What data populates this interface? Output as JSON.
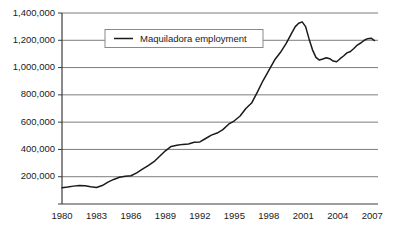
{
  "chart_data": {
    "type": "line",
    "title": "",
    "subtitle": "",
    "xlabel": "",
    "ylabel": "",
    "grid": "horizontal",
    "legend_position": "top-center",
    "xlim": [
      1980,
      2007.5
    ],
    "ylim": [
      0,
      1400000
    ],
    "yticks": [
      0,
      200000,
      400000,
      600000,
      800000,
      1000000,
      1200000,
      1400000
    ],
    "ytick_labels": [
      "",
      "200,000",
      "400,000",
      "600,000",
      "800,000",
      "1,000,000",
      "1,200,000",
      "1,400,000"
    ],
    "xticks": [
      1980,
      1983,
      1986,
      1989,
      1992,
      1995,
      1998,
      2001,
      2004,
      2007
    ],
    "xtick_labels": [
      "1980",
      "1983",
      "1986",
      "1989",
      "1992",
      "1995",
      "1998",
      "2001",
      "2004",
      "2007"
    ],
    "series": [
      {
        "name": "Maquiladora employment",
        "color": "#1a1a1a",
        "x": [
          1980.0,
          1980.5,
          1981.0,
          1981.5,
          1982.0,
          1982.5,
          1983.0,
          1983.5,
          1984.0,
          1984.5,
          1985.0,
          1985.5,
          1986.0,
          1986.5,
          1987.0,
          1987.5,
          1988.0,
          1988.5,
          1989.0,
          1989.5,
          1990.0,
          1990.5,
          1991.0,
          1991.5,
          1992.0,
          1992.5,
          1993.0,
          1993.5,
          1994.0,
          1994.5,
          1995.0,
          1995.5,
          1996.0,
          1996.5,
          1997.0,
          1997.5,
          1998.0,
          1998.5,
          1999.0,
          1999.5,
          2000.0,
          2000.3,
          2000.6,
          2000.9,
          2001.2,
          2001.5,
          2001.8,
          2002.1,
          2002.4,
          2002.7,
          2003.0,
          2003.3,
          2003.6,
          2003.9,
          2004.2,
          2004.5,
          2004.8,
          2005.1,
          2005.4,
          2005.7,
          2006.0,
          2006.3,
          2006.6,
          2006.9,
          2007.2
        ],
        "y": [
          119000,
          124000,
          131000,
          136000,
          133000,
          126000,
          121000,
          135000,
          160000,
          180000,
          196000,
          203000,
          207000,
          228000,
          255000,
          282000,
          310000,
          350000,
          390000,
          422000,
          430000,
          437000,
          440000,
          452000,
          455000,
          480000,
          505000,
          520000,
          545000,
          585000,
          610000,
          645000,
          700000,
          740000,
          820000,
          905000,
          980000,
          1055000,
          1110000,
          1175000,
          1255000,
          1300000,
          1325000,
          1335000,
          1300000,
          1210000,
          1130000,
          1075000,
          1055000,
          1063000,
          1072000,
          1065000,
          1048000,
          1043000,
          1065000,
          1085000,
          1108000,
          1118000,
          1140000,
          1165000,
          1180000,
          1200000,
          1212000,
          1215000,
          1198000
        ]
      }
    ],
    "legend": [
      {
        "label": "Maquiladora employment",
        "color": "#1a1a1a"
      }
    ]
  },
  "axes": {
    "axis_color": "#3c3c3c",
    "grid_color": "#7d7d7d",
    "background": "#ffffff"
  },
  "legend_box": {
    "border_color": "#8a8a8a",
    "background": "#ffffff"
  }
}
